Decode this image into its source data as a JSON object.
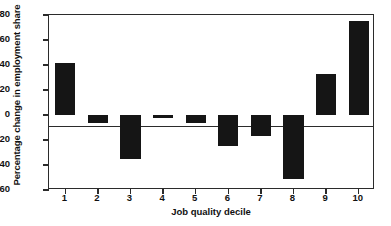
{
  "chart_data": {
    "type": "bar",
    "title": "",
    "xlabel": "Job quality decile",
    "ylabel": "Percentage change in employment share",
    "categories": [
      "1",
      "2",
      "3",
      "4",
      "5",
      "6",
      "7",
      "8",
      "9",
      "10"
    ],
    "values": [
      42,
      -6,
      -35,
      -2,
      -6,
      -25,
      -17,
      -51,
      33,
      75
    ],
    "ylim": [
      -60,
      80
    ],
    "yticks": [
      -60,
      -40,
      -20,
      0,
      20,
      40,
      60,
      80
    ],
    "ytick_labels": [
      "-60",
      "-40",
      "-20",
      "0",
      "20",
      "40",
      "60",
      "80"
    ],
    "grid": false,
    "legend": null,
    "bar_color": "#151515",
    "axis_color": "#2b2b2b",
    "background": "#ffffff"
  }
}
